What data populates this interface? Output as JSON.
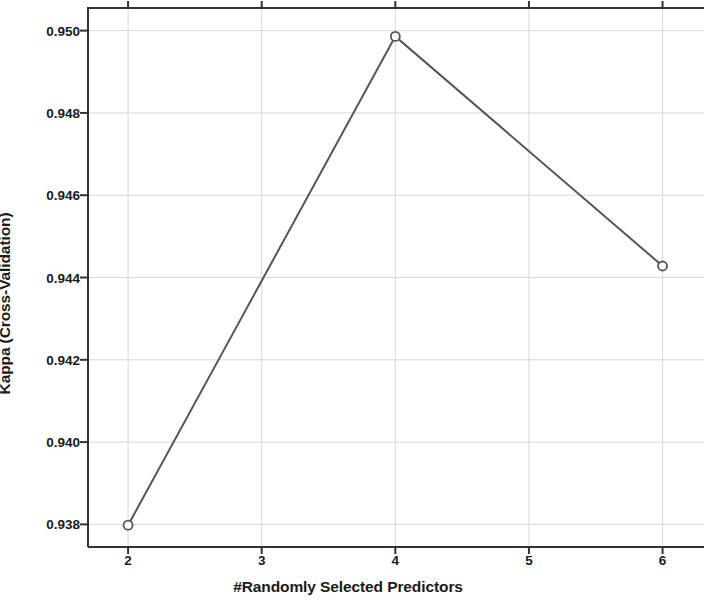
{
  "chart_data": {
    "type": "line",
    "title": "",
    "xlabel": "#Randomly Selected Predictors",
    "ylabel": "Kappa (Cross-Validation)",
    "x": [
      2,
      4,
      6
    ],
    "values": [
      0.93798,
      0.94986,
      0.94428
    ],
    "series": [
      {
        "name": "Kappa (Cross-Validation)",
        "x": [
          2,
          4,
          6
        ],
        "values": [
          0.93798,
          0.94986,
          0.94428
        ]
      }
    ],
    "xlim": [
      1.7,
      6.4
    ],
    "ylim": [
      0.93745,
      0.95055
    ],
    "xticks": [
      2,
      3,
      4,
      5,
      6
    ],
    "xtick_labels": [
      "2",
      "3",
      "4",
      "5",
      "6"
    ],
    "yticks": [
      0.938,
      0.94,
      0.942,
      0.944,
      0.946,
      0.948,
      0.95
    ],
    "ytick_labels": [
      "0.938",
      "0.940",
      "0.942",
      "0.944",
      "0.946",
      "0.948",
      "0.950"
    ],
    "grid": true,
    "legend": "none",
    "marker": "open-circle",
    "line_color": "#555555",
    "marker_color": "#555555",
    "grid_color": "#d8d8d8",
    "axis_color": "#333333"
  }
}
